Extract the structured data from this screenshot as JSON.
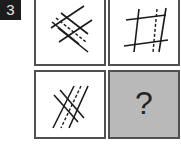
{
  "question": {
    "number": "3"
  },
  "grid": {
    "cells": [
      {
        "position": "top-left",
        "type": "figure",
        "description": "two solid parallel lines crossing two solid parallel lines diagonally, with a dashed line between"
      },
      {
        "position": "top-right",
        "type": "figure",
        "description": "two near-horizontal solid lines crossing two near-vertical solid lines plus one dashed vertical line"
      },
      {
        "position": "bottom-left",
        "type": "figure",
        "description": "steep diagonal solid lines with dashed line, crossed by two parallel lines"
      },
      {
        "position": "bottom-right",
        "type": "answer-placeholder",
        "label": "?"
      }
    ]
  },
  "colors": {
    "badge_bg": "#1c1c1c",
    "border": "#505050",
    "answer_bg": "#b9b9b9",
    "line": "#1a1a1a"
  }
}
